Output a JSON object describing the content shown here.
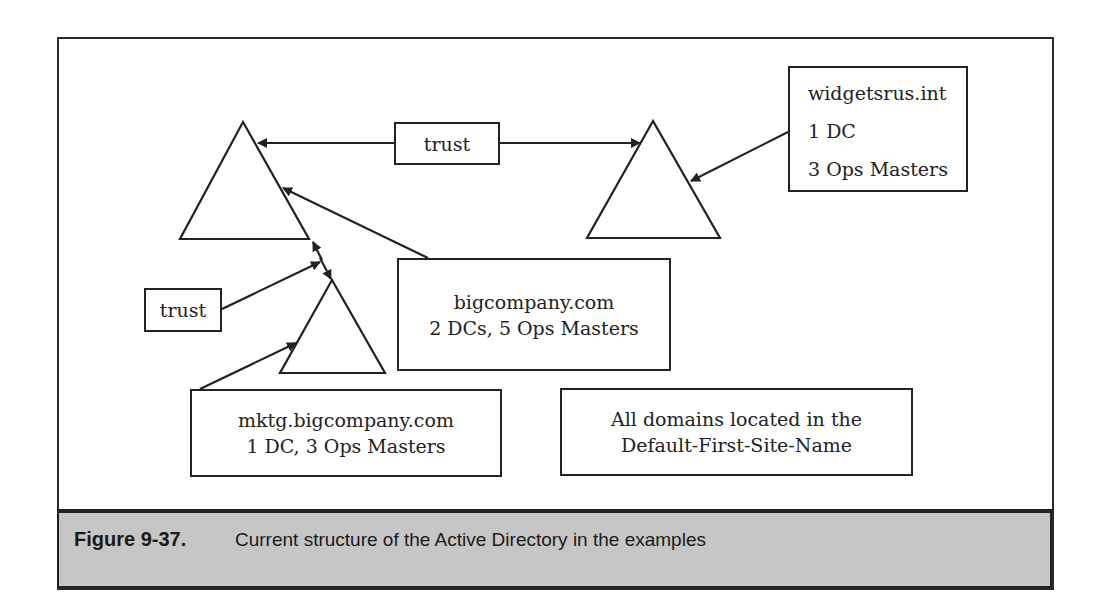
{
  "diagram": {
    "domains": [
      {
        "id": "bigcompany",
        "shape": "triangle"
      },
      {
        "id": "widgetsrus",
        "shape": "triangle"
      },
      {
        "id": "mktg",
        "shape": "triangle"
      }
    ],
    "trust_labels": {
      "top": "trust",
      "left": "trust"
    },
    "boxes": {
      "widgetsrus": {
        "line1": "widgetsrus.int",
        "line2": "1 DC",
        "line3": "3 Ops Masters"
      },
      "bigcompany": {
        "line1": "bigcompany.com",
        "line2": "2 DCs, 5 Ops Masters"
      },
      "mktg": {
        "line1": "mktg.bigcompany.com",
        "line2": "1 DC, 3 Ops Masters"
      },
      "site_note": {
        "line1": "All domains located in the",
        "line2": "Default-First-Site-Name"
      }
    },
    "colors": {
      "stroke": "#222222",
      "caption_bg": "#c6c6c6"
    }
  },
  "caption": {
    "number": "Figure 9-37.",
    "text": "Current structure of the Active Directory in the examples"
  }
}
